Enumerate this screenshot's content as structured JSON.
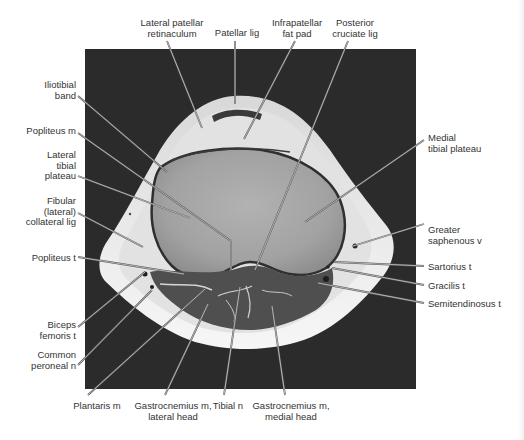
{
  "figure": {
    "colors": {
      "background": "#ffffff",
      "mri_background": "#2a2a2a",
      "subcutaneous_fat": "#efefef",
      "bone": "#a9a9a9",
      "muscle": "#505050",
      "label_text": "#333333",
      "leader_line": "#444444"
    }
  },
  "labels": {
    "top": [
      {
        "id": "lateral-patellar-retinaculum",
        "text": "Lateral patellar\nretinaculum"
      },
      {
        "id": "patellar-lig",
        "text": "Patellar lig"
      },
      {
        "id": "infrapatellar-fat-pad",
        "text": "Infrapatellar\nfat pad"
      },
      {
        "id": "posterior-cruciate-lig",
        "text": "Posterior\ncruciate lig"
      }
    ],
    "left": [
      {
        "id": "iliotibial-band",
        "text": "Iliotibial\nband"
      },
      {
        "id": "popliteus-m",
        "text": "Popliteus m"
      },
      {
        "id": "lateral-tibial-plateau",
        "text": "Lateral\ntibial\nplateau"
      },
      {
        "id": "fibular-collateral-lig",
        "text": "Fibular\n(lateral)\ncollateral lig"
      },
      {
        "id": "popliteus-t",
        "text": "Popliteus t"
      },
      {
        "id": "biceps-femoris-t",
        "text": "Biceps\nfemoris t"
      },
      {
        "id": "common-peroneal-n",
        "text": "Common\nperoneal n"
      }
    ],
    "right": [
      {
        "id": "medial-tibial-plateau",
        "text": "Medial\ntibial plateau"
      },
      {
        "id": "greater-saphenous-v",
        "text": "Greater\nsaphenous v"
      },
      {
        "id": "sartorius-t",
        "text": "Sartorius t"
      },
      {
        "id": "gracilis-t",
        "text": "Gracilis t"
      },
      {
        "id": "semitendinosus-t",
        "text": "Semitendinosus t"
      }
    ],
    "bottom": [
      {
        "id": "plantaris-m",
        "text": "Plantaris m"
      },
      {
        "id": "gastrocnemius-lateral-head",
        "text": "Gastrocnemius m,\nlateral head"
      },
      {
        "id": "tibial-n",
        "text": "Tibial n"
      },
      {
        "id": "gastrocnemius-medial-head",
        "text": "Gastrocnemius m,\nmedial head"
      }
    ]
  }
}
